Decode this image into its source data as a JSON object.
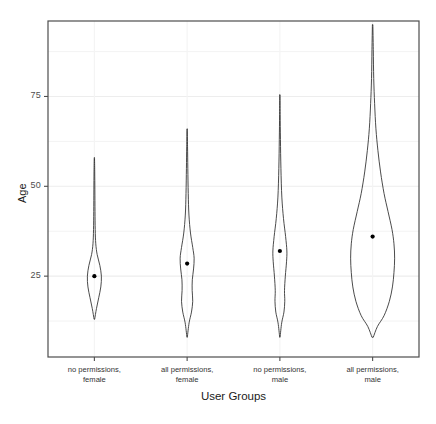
{
  "chart_data": {
    "type": "violin",
    "title": "",
    "xlabel": "User Groups",
    "ylabel": "Age",
    "categories": [
      "no permissions,\nfemale",
      "all permissions,\nfemale",
      "no permissions,\nmale",
      "all permissions,\nmale"
    ],
    "category_lines": [
      [
        "no permissions,",
        "female"
      ],
      [
        "all permissions,",
        "female"
      ],
      [
        "no permissions,",
        "male"
      ],
      [
        "all permissions,",
        "male"
      ]
    ],
    "y_ticks": [
      25,
      50,
      75
    ],
    "y_tick_labels": [
      "25",
      "50",
      "75"
    ],
    "y_minor_ticks": [
      12.5,
      37.5,
      62.5,
      87.5
    ],
    "ylim": [
      2.5,
      96
    ],
    "grid": true,
    "grid_vertical": true,
    "legend": "none",
    "series": [
      {
        "name": "no permissions, female",
        "mean": 25,
        "min": 13,
        "max": 58,
        "max_half_width_px": 7,
        "density": [
          [
            13,
            0.04
          ],
          [
            16,
            0.3
          ],
          [
            19,
            0.62
          ],
          [
            22,
            0.92
          ],
          [
            25,
            1.0
          ],
          [
            28,
            0.78
          ],
          [
            31,
            0.4
          ],
          [
            34,
            0.2
          ],
          [
            38,
            0.12
          ],
          [
            43,
            0.09
          ],
          [
            49,
            0.07
          ],
          [
            54,
            0.05
          ],
          [
            58,
            0.02
          ]
        ]
      },
      {
        "name": "all permissions, female",
        "mean": 28.5,
        "min": 8,
        "max": 66,
        "max_half_width_px": 7,
        "density": [
          [
            8,
            0.03
          ],
          [
            12,
            0.28
          ],
          [
            15,
            0.62
          ],
          [
            18,
            0.8
          ],
          [
            21,
            0.72
          ],
          [
            24,
            0.74
          ],
          [
            27,
            0.92
          ],
          [
            30,
            1.0
          ],
          [
            33,
            0.8
          ],
          [
            37,
            0.48
          ],
          [
            42,
            0.26
          ],
          [
            48,
            0.16
          ],
          [
            55,
            0.1
          ],
          [
            61,
            0.06
          ],
          [
            66,
            0.02
          ]
        ]
      },
      {
        "name": "no permissions, male",
        "mean": 32,
        "min": 8,
        "max": 75.5,
        "max_half_width_px": 7,
        "density": [
          [
            8,
            0.03
          ],
          [
            12,
            0.26
          ],
          [
            15,
            0.58
          ],
          [
            18,
            0.7
          ],
          [
            21,
            0.66
          ],
          [
            25,
            0.78
          ],
          [
            29,
            0.95
          ],
          [
            32,
            1.0
          ],
          [
            36,
            0.82
          ],
          [
            41,
            0.52
          ],
          [
            47,
            0.28
          ],
          [
            55,
            0.15
          ],
          [
            63,
            0.08
          ],
          [
            70,
            0.04
          ],
          [
            75.5,
            0.02
          ]
        ]
      },
      {
        "name": "all permissions, male",
        "mean": 36,
        "min": 8,
        "max": 95,
        "max_half_width_px": 22,
        "density": [
          [
            8,
            0.03
          ],
          [
            11,
            0.22
          ],
          [
            14,
            0.52
          ],
          [
            18,
            0.76
          ],
          [
            22,
            0.9
          ],
          [
            26,
            0.97
          ],
          [
            30,
            1.0
          ],
          [
            34,
            0.97
          ],
          [
            38,
            0.88
          ],
          [
            43,
            0.7
          ],
          [
            48,
            0.52
          ],
          [
            54,
            0.36
          ],
          [
            60,
            0.24
          ],
          [
            66,
            0.15
          ],
          [
            73,
            0.09
          ],
          [
            80,
            0.05
          ],
          [
            88,
            0.03
          ],
          [
            95,
            0.01
          ]
        ]
      }
    ],
    "style": {
      "line_color": "#2b2b2b",
      "point_color": "#000000",
      "panel_border_color": "#4d4d4d",
      "grid_color": "#f2f2f2",
      "background": "#ffffff"
    }
  },
  "panel": {
    "left_px": 48,
    "right_px": 419,
    "top_px": 21,
    "bottom_px": 357
  }
}
